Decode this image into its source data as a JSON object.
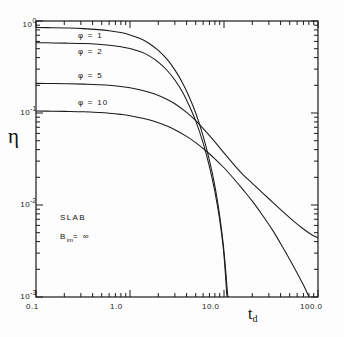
{
  "chart_data": {
    "type": "line",
    "title": "",
    "xlabel": "t_d",
    "ylabel": "η",
    "xscale": "log",
    "yscale": "log",
    "xlim": [
      0.1,
      100.0
    ],
    "ylim": [
      0.001,
      1.0
    ],
    "grid": false,
    "legend_position": "inline-annotations",
    "x_tick_labels": [
      "0.1",
      "1.0",
      "10.0",
      "100.0"
    ],
    "x_tick_values": [
      0.1,
      1.0,
      10.0,
      100.0
    ],
    "y_tick_labels": [
      "10 0",
      "10 -1",
      "10 -2",
      "10 -3"
    ],
    "y_tick_values": [
      1.0,
      0.1,
      0.01,
      0.001
    ],
    "y_tick_mantissa": [
      "10",
      "10",
      "10",
      "10"
    ],
    "y_tick_exponent": [
      "0",
      "-1",
      "-2",
      "-3"
    ],
    "annotations": [
      {
        "name": "geometry",
        "text": "SLAB"
      },
      {
        "name": "biot-number",
        "base": "B",
        "sub": "im",
        "rest": "= ∞"
      }
    ],
    "series": [
      {
        "name": "phi-1",
        "label": "φ = 1",
        "phi": 1,
        "label_x": 0.28,
        "label_y": 0.68,
        "points": [
          [
            0.1,
            0.85
          ],
          [
            0.15,
            0.845
          ],
          [
            0.22,
            0.838
          ],
          [
            0.32,
            0.826
          ],
          [
            0.46,
            0.806
          ],
          [
            0.6,
            0.784
          ],
          [
            0.8,
            0.748
          ],
          [
            1.0,
            0.706
          ],
          [
            1.3,
            0.64
          ],
          [
            1.6,
            0.57
          ],
          [
            2.0,
            0.48
          ],
          [
            2.5,
            0.38
          ],
          [
            3.0,
            0.294
          ],
          [
            3.6,
            0.215
          ],
          [
            4.2,
            0.155
          ],
          [
            5.0,
            0.1
          ],
          [
            6.0,
            0.056
          ],
          [
            7.0,
            0.0305
          ],
          [
            8.0,
            0.016
          ],
          [
            9.0,
            0.0076
          ],
          [
            9.8,
            0.0038
          ],
          [
            10.4,
            0.002
          ],
          [
            10.9,
            0.0011
          ],
          [
            11.15,
            0.001
          ]
        ]
      },
      {
        "name": "phi-2",
        "label": "φ = 2",
        "phi": 2,
        "label_x": 0.28,
        "label_y": 0.46,
        "points": [
          [
            0.1,
            0.58
          ],
          [
            0.15,
            0.578
          ],
          [
            0.22,
            0.574
          ],
          [
            0.32,
            0.568
          ],
          [
            0.46,
            0.558
          ],
          [
            0.6,
            0.546
          ],
          [
            0.8,
            0.526
          ],
          [
            1.0,
            0.502
          ],
          [
            1.3,
            0.462
          ],
          [
            1.6,
            0.418
          ],
          [
            2.0,
            0.358
          ],
          [
            2.5,
            0.288
          ],
          [
            3.0,
            0.228
          ],
          [
            3.6,
            0.17
          ],
          [
            4.2,
            0.124
          ],
          [
            5.0,
            0.082
          ],
          [
            6.0,
            0.047
          ],
          [
            7.0,
            0.0262
          ],
          [
            8.0,
            0.014
          ],
          [
            9.0,
            0.0069
          ],
          [
            9.8,
            0.0035
          ],
          [
            10.3,
            0.0019
          ],
          [
            10.7,
            0.00108
          ],
          [
            10.9,
            0.001
          ]
        ]
      },
      {
        "name": "phi-5",
        "label": "φ = 5",
        "phi": 5,
        "label_x": 0.28,
        "label_y": 0.255,
        "points": [
          [
            0.1,
            0.21
          ],
          [
            0.15,
            0.209
          ],
          [
            0.22,
            0.208
          ],
          [
            0.32,
            0.206
          ],
          [
            0.46,
            0.203
          ],
          [
            0.6,
            0.2
          ],
          [
            0.8,
            0.194
          ],
          [
            1.0,
            0.188
          ],
          [
            1.4,
            0.175
          ],
          [
            1.8,
            0.162
          ],
          [
            2.4,
            0.143
          ],
          [
            3.0,
            0.126
          ],
          [
            4.0,
            0.1015
          ],
          [
            5.0,
            0.0825
          ],
          [
            6.5,
            0.062
          ],
          [
            8.0,
            0.0486
          ],
          [
            10.0,
            0.0368
          ],
          [
            13.0,
            0.0268
          ],
          [
            16.0,
            0.0213
          ],
          [
            20.0,
            0.0172
          ],
          [
            26.0,
            0.0134
          ],
          [
            33.0,
            0.0107
          ],
          [
            42.0,
            0.00852
          ],
          [
            55.0,
            0.00668
          ],
          [
            70.0,
            0.00548
          ],
          [
            85.0,
            0.00478
          ],
          [
            100.0,
            0.0044
          ]
        ]
      },
      {
        "name": "phi-10",
        "label": "φ = 10",
        "phi": 10,
        "label_x": 0.28,
        "label_y": 0.128,
        "points": [
          [
            0.1,
            0.105
          ],
          [
            0.15,
            0.1046
          ],
          [
            0.22,
            0.104
          ],
          [
            0.32,
            0.103
          ],
          [
            0.46,
            0.1012
          ],
          [
            0.6,
            0.0995
          ],
          [
            0.8,
            0.0966
          ],
          [
            1.0,
            0.0935
          ],
          [
            1.4,
            0.0872
          ],
          [
            1.8,
            0.0812
          ],
          [
            2.4,
            0.073
          ],
          [
            3.0,
            0.0658
          ],
          [
            4.0,
            0.0557
          ],
          [
            5.0,
            0.0476
          ],
          [
            6.5,
            0.0384
          ],
          [
            8.0,
            0.0318
          ],
          [
            10.0,
            0.0254
          ],
          [
            13.0,
            0.0188
          ],
          [
            16.0,
            0.0146
          ],
          [
            20.0,
            0.011
          ],
          [
            26.0,
            0.0076
          ],
          [
            33.0,
            0.0053
          ],
          [
            42.0,
            0.0035
          ],
          [
            55.0,
            0.00215
          ],
          [
            70.0,
            0.00135
          ],
          [
            85.0,
            0.00088
          ],
          [
            97.0,
            0.00064
          ],
          [
            105.0,
            0.001
          ]
        ]
      }
    ]
  },
  "axes": {
    "x_title_base": "t",
    "x_title_sub": "d",
    "y_title": "η"
  },
  "colors": {
    "line": "#1a1a1a",
    "axis": "#1a1a1a",
    "background": "#fdfdfd"
  }
}
